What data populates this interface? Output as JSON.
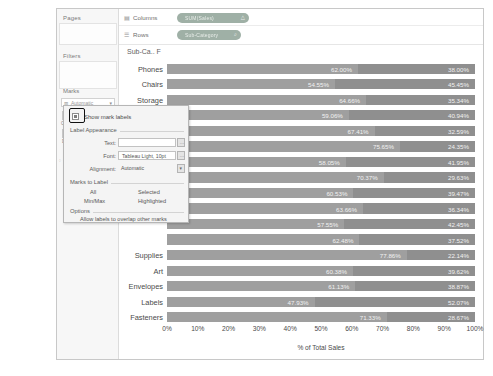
{
  "sidebar": {
    "pages_label": "Pages",
    "filters_label": "Filters",
    "marks_label": "Marks",
    "mark_type": "Automatic",
    "mark_type_icon": "bar-icon",
    "buttons": [
      {
        "label": "Colour",
        "icon": "colour-icon"
      },
      {
        "label": "Size",
        "icon": "size-icon"
      },
      {
        "label": "Label",
        "icon": "label-icon"
      },
      {
        "label": "Detail",
        "icon": "detail-icon"
      },
      {
        "label": "Tooltip",
        "icon": "tooltip-icon"
      }
    ],
    "detail_pill": "Sub-Cat..."
  },
  "shelves": [
    {
      "name": "Columns",
      "icon": "columns-icon",
      "pill": "SUM(Sales)",
      "pill_icon": "delta-icon"
    },
    {
      "name": "Rows",
      "icon": "rows-icon",
      "pill": "Sub-Category",
      "pill_icon": "filter-icon"
    }
  ],
  "chart_corner_label": "Sub-Ca.. F",
  "dialog": {
    "show_mark_labels": "Show mark labels",
    "appearance_title": "Label Appearance",
    "fields": [
      {
        "label": "Text:",
        "value": ""
      },
      {
        "label": "Font:",
        "value": "Tableau Light, 10pt"
      },
      {
        "label": "Alignment:",
        "value": "Automatic"
      }
    ],
    "marks_to_label_title": "Marks to Label",
    "marks_to_label_options": [
      "All",
      "Selected",
      "Min/Max",
      "Highlighted"
    ],
    "options_title": "Options",
    "overlap_option": "Allow labels to overlap other marks"
  },
  "chart_data": {
    "type": "bar",
    "orientation": "horizontal",
    "stacked": true,
    "title": "",
    "xlabel": "% of Total Sales",
    "ylabel": "",
    "xlim": [
      0,
      100
    ],
    "xticks": [
      "0%",
      "10%",
      "20%",
      "30%",
      "40%",
      "50%",
      "60%",
      "70%",
      "80%",
      "90%",
      "100%"
    ],
    "grid": false,
    "legend": "none",
    "categories": [
      "Phones",
      "Chairs",
      "Storage",
      "Tables",
      "",
      "",
      "",
      "",
      "",
      "",
      "",
      "",
      "Supplies",
      "Art",
      "Envelopes",
      "Labels",
      "Fasteners"
    ],
    "series": [
      {
        "name": "segment-1",
        "values": [
          62.0,
          54.55,
          64.66,
          59.06,
          67.41,
          75.65,
          58.05,
          70.37,
          60.53,
          63.66,
          57.55,
          62.48,
          77.86,
          60.38,
          61.13,
          47.93,
          71.33
        ]
      },
      {
        "name": "segment-2",
        "values": [
          38.0,
          45.45,
          35.34,
          40.94,
          32.59,
          24.35,
          41.95,
          29.63,
          39.47,
          36.34,
          42.45,
          37.52,
          22.14,
          39.62,
          38.87,
          52.07,
          28.67
        ]
      }
    ],
    "value_labels": [
      [
        "62.00%",
        "38.00%"
      ],
      [
        "54.55%",
        "45.45%"
      ],
      [
        "64.66%",
        "35.34%"
      ],
      [
        "59.06%",
        "40.94%"
      ],
      [
        "67.41%",
        "32.59%"
      ],
      [
        "75.65%",
        "24.35%"
      ],
      [
        "58.05%",
        "41.95%"
      ],
      [
        "70.37%",
        "29.63%"
      ],
      [
        "60.53%",
        "39.47%"
      ],
      [
        "63.66%",
        "36.34%"
      ],
      [
        "57.55%",
        "42.45%"
      ],
      [
        "62.48%",
        "37.52%"
      ],
      [
        "77.86%",
        "22.14%"
      ],
      [
        "60.38%",
        "39.62%"
      ],
      [
        "61.13%",
        "38.87%"
      ],
      [
        "47.93%",
        "52.07%"
      ],
      [
        "71.33%",
        "28.67%"
      ]
    ]
  }
}
